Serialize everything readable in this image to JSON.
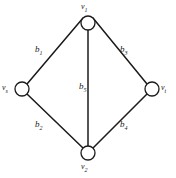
{
  "figure": {
    "type": "undirected-graph-diagram",
    "background_color": "#ffffff",
    "stroke_color": "#1a1a1a",
    "text_color": "#1a1a1a"
  },
  "vertices": [
    {
      "id": "v1",
      "base": "v",
      "subscript": "1",
      "label": "v₁",
      "cx": 88,
      "cy": 23,
      "r": 7
    },
    {
      "id": "vs",
      "base": "v",
      "subscript": "s",
      "label": "vₛ",
      "cx": 22,
      "cy": 89,
      "r": 7
    },
    {
      "id": "vt",
      "base": "v",
      "subscript": "t",
      "label": "vₜ",
      "cx": 152,
      "cy": 89,
      "r": 7
    },
    {
      "id": "v2",
      "base": "v",
      "subscript": "2",
      "label": "v₂",
      "cx": 88,
      "cy": 153,
      "r": 7
    }
  ],
  "edges": [
    {
      "id": "b1",
      "base": "b",
      "subscript": "1",
      "label": "b₁",
      "from": "v1",
      "to": "vs"
    },
    {
      "id": "b2",
      "base": "b",
      "subscript": "2",
      "label": "b₂",
      "from": "vs",
      "to": "v2"
    },
    {
      "id": "b3",
      "base": "b",
      "subscript": "3",
      "label": "b₃",
      "from": "v1",
      "to": "vt"
    },
    {
      "id": "b4",
      "base": "b",
      "subscript": "4",
      "label": "b₄",
      "from": "vt",
      "to": "v2"
    },
    {
      "id": "b5",
      "base": "b",
      "subscript": "5",
      "label": "b₅",
      "from": "v1",
      "to": "v2"
    }
  ],
  "labels": {
    "v1_base": "v",
    "v1_sub": "1",
    "vs_base": "v",
    "vs_sub": "s",
    "vt_base": "v",
    "vt_sub": "t",
    "v2_base": "v",
    "v2_sub": "2",
    "b1_base": "b",
    "b1_sub": "1",
    "b2_base": "b",
    "b2_sub": "2",
    "b3_base": "b",
    "b3_sub": "3",
    "b4_base": "b",
    "b4_sub": "4",
    "b5_base": "b",
    "b5_sub": "5"
  }
}
